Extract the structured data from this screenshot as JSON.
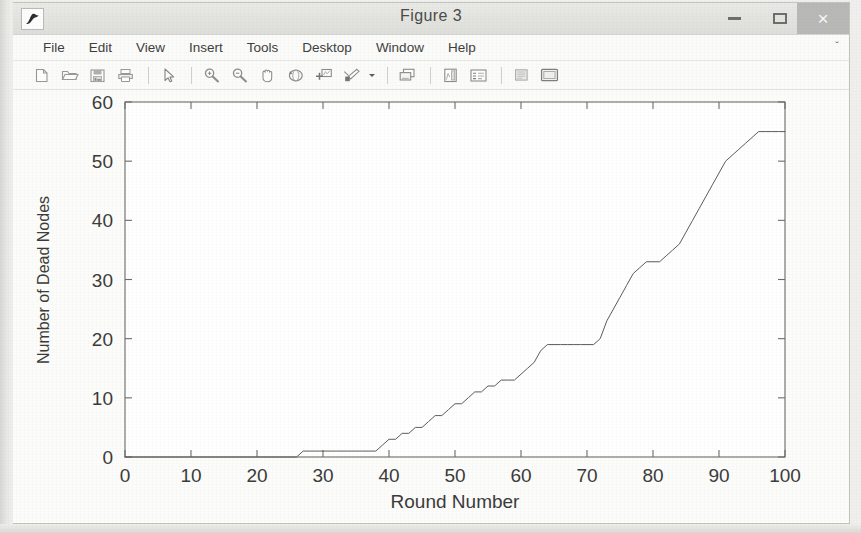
{
  "window": {
    "title": "Figure 3",
    "app_icon": "matlab-figure-icon",
    "controls": {
      "minimize": "minimize-icon",
      "maximize": "maximize-icon",
      "close": "×"
    }
  },
  "menu": {
    "items": [
      {
        "label": "File",
        "name": "menu-file"
      },
      {
        "label": "Edit",
        "name": "menu-edit"
      },
      {
        "label": "View",
        "name": "menu-view"
      },
      {
        "label": "Insert",
        "name": "menu-insert"
      },
      {
        "label": "Tools",
        "name": "menu-tools"
      },
      {
        "label": "Desktop",
        "name": "menu-desktop"
      },
      {
        "label": "Window",
        "name": "menu-window"
      },
      {
        "label": "Help",
        "name": "menu-help"
      }
    ],
    "overflow_glyph": "ˇ"
  },
  "toolbar": {
    "buttons": [
      {
        "name": "new-figure-icon",
        "tip": "New Figure"
      },
      {
        "name": "open-file-icon",
        "tip": "Open File"
      },
      {
        "name": "save-figure-icon",
        "tip": "Save Figure"
      },
      {
        "name": "print-figure-icon",
        "tip": "Print Figure"
      },
      {
        "name": "separator-1",
        "tip": ""
      },
      {
        "name": "edit-plot-pointer-icon",
        "tip": "Edit Plot"
      },
      {
        "name": "separator-2",
        "tip": ""
      },
      {
        "name": "zoom-in-icon",
        "tip": "Zoom In"
      },
      {
        "name": "zoom-out-icon",
        "tip": "Zoom Out"
      },
      {
        "name": "pan-hand-icon",
        "tip": "Pan"
      },
      {
        "name": "rotate-3d-icon",
        "tip": "Rotate 3D"
      },
      {
        "name": "data-cursor-icon",
        "tip": "Data Cursor"
      },
      {
        "name": "brush-data-icon",
        "tip": "Brush/Select Data"
      },
      {
        "name": "brush-dropdown-caret-icon",
        "tip": "Brush options"
      },
      {
        "name": "separator-3",
        "tip": ""
      },
      {
        "name": "link-plot-icon",
        "tip": "Link Plot"
      },
      {
        "name": "separator-4",
        "tip": ""
      },
      {
        "name": "insert-colorbar-icon",
        "tip": "Insert Colorbar"
      },
      {
        "name": "insert-legend-icon",
        "tip": "Insert Legend"
      },
      {
        "name": "separator-5",
        "tip": ""
      },
      {
        "name": "plot-browser-icon",
        "tip": "Show Plot Tools"
      },
      {
        "name": "figure-palette-icon",
        "tip": "Hide Plot Tools"
      }
    ]
  },
  "chart_data": {
    "type": "line",
    "title": "",
    "xlabel": "Round Number",
    "ylabel": "Number of Dead Nodes",
    "xlim": [
      0,
      100
    ],
    "ylim": [
      0,
      60
    ],
    "xticks": [
      0,
      10,
      20,
      30,
      40,
      50,
      60,
      70,
      80,
      90,
      100
    ],
    "yticks": [
      0,
      10,
      20,
      30,
      40,
      50,
      60
    ],
    "grid": false,
    "legend": null,
    "line_color": "#5a5a58",
    "line_width": 1,
    "series": [
      {
        "name": "Dead Nodes",
        "x": [
          0,
          26,
          27,
          28,
          32,
          36,
          37,
          38,
          39,
          40,
          41,
          42,
          43,
          44,
          45,
          46,
          47,
          48,
          49,
          50,
          51,
          52,
          53,
          54,
          55,
          56,
          57,
          58,
          59,
          60,
          61,
          62,
          63,
          64,
          65,
          66,
          67,
          68,
          69,
          70,
          71,
          72,
          73,
          74,
          75,
          76,
          77,
          78,
          79,
          80,
          81,
          82,
          83,
          84,
          85,
          86,
          87,
          88,
          89,
          90,
          91,
          92,
          93,
          94,
          95,
          96,
          97,
          98,
          99,
          100
        ],
        "y": [
          0,
          0,
          1,
          1,
          1,
          1,
          1,
          1,
          2,
          3,
          3,
          4,
          4,
          5,
          5,
          6,
          7,
          7,
          8,
          9,
          9,
          10,
          11,
          11,
          12,
          12,
          13,
          13,
          13,
          14,
          15,
          16,
          18,
          19,
          19,
          19,
          19,
          19,
          19,
          19,
          19,
          20,
          23,
          25,
          27,
          29,
          31,
          32,
          33,
          33,
          33,
          34,
          35,
          36,
          38,
          40,
          42,
          44,
          46,
          48,
          50,
          51,
          52,
          53,
          54,
          55,
          55,
          55,
          55,
          55
        ]
      }
    ]
  }
}
